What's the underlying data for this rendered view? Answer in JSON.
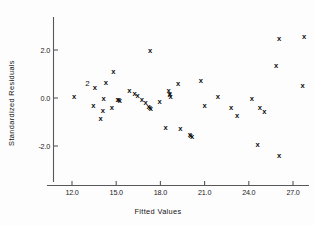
{
  "chart_data": {
    "type": "scatter",
    "title": "",
    "xlabel": "Fitted Values",
    "ylabel": "Standardized Residuals",
    "xlim": [
      10.7,
      28.8
    ],
    "ylim": [
      -3.1,
      3.2
    ],
    "grid": false,
    "legend": null,
    "marker": "x",
    "xticks": [
      12.0,
      15.0,
      18.0,
      21.0,
      24.0,
      27.0
    ],
    "xtick_labels": [
      "12.0",
      "15.0",
      "18.0",
      "21.0",
      "24.0",
      "27.0"
    ],
    "yticks": [
      2.0,
      0.0,
      -2.0
    ],
    "ytick_labels": [
      "2.0",
      "0.0",
      "-2.0"
    ],
    "points": [
      {
        "x": 12.15,
        "y": 0.05
      },
      {
        "x": 13.55,
        "y": 0.45
      },
      {
        "x": 13.45,
        "y": -0.3
      },
      {
        "x": 14.15,
        "y": 0.0
      },
      {
        "x": 14.3,
        "y": 0.65
      },
      {
        "x": 14.1,
        "y": -0.5
      },
      {
        "x": 13.95,
        "y": -0.85
      },
      {
        "x": 14.8,
        "y": 1.1
      },
      {
        "x": 14.7,
        "y": -0.4
      },
      {
        "x": 15.1,
        "y": -0.05
      },
      {
        "x": 15.25,
        "y": -0.1
      },
      {
        "x": 15.9,
        "y": 0.3
      },
      {
        "x": 16.25,
        "y": 0.2
      },
      {
        "x": 16.45,
        "y": 0.1
      },
      {
        "x": 16.75,
        "y": -0.05
      },
      {
        "x": 17.0,
        "y": -0.2
      },
      {
        "x": 17.2,
        "y": -0.35
      },
      {
        "x": 17.35,
        "y": -0.42
      },
      {
        "x": 17.3,
        "y": 2.0
      },
      {
        "x": 17.95,
        "y": -0.15
      },
      {
        "x": 18.55,
        "y": 0.3
      },
      {
        "x": 18.65,
        "y": 0.2
      },
      {
        "x": 18.7,
        "y": 0.08
      },
      {
        "x": 19.2,
        "y": 0.6
      },
      {
        "x": 18.35,
        "y": -1.22
      },
      {
        "x": 19.35,
        "y": -1.25
      },
      {
        "x": 20.0,
        "y": -1.52
      },
      {
        "x": 20.15,
        "y": -1.62
      },
      {
        "x": 20.75,
        "y": 0.75
      },
      {
        "x": 21.0,
        "y": -0.32
      },
      {
        "x": 21.9,
        "y": 0.05
      },
      {
        "x": 22.8,
        "y": -0.38
      },
      {
        "x": 23.2,
        "y": -0.72
      },
      {
        "x": 24.2,
        "y": 0.0
      },
      {
        "x": 24.75,
        "y": -0.38
      },
      {
        "x": 25.05,
        "y": -0.55
      },
      {
        "x": 24.6,
        "y": -1.95
      },
      {
        "x": 26.05,
        "y": 2.48
      },
      {
        "x": 25.85,
        "y": 1.35
      },
      {
        "x": 26.05,
        "y": -2.4
      },
      {
        "x": 27.75,
        "y": 2.55
      },
      {
        "x": 27.65,
        "y": 0.52
      }
    ],
    "count_labels": [
      {
        "x": 13.05,
        "y": 0.62,
        "text": "2"
      }
    ],
    "overlap_markers": [
      {
        "x": 15.18,
        "y": -0.07
      },
      {
        "x": 17.28,
        "y": -0.4
      },
      {
        "x": 20.05,
        "y": -1.55
      },
      {
        "x": 18.62,
        "y": 0.14
      }
    ]
  },
  "axes": {
    "x_axis_name": "x-axis",
    "y_axis_name": "y-axis"
  }
}
